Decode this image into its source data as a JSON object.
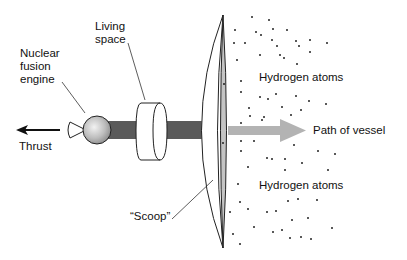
{
  "labels": {
    "nuclear_fusion_engine": [
      "Nuclear",
      "fusion",
      "engine"
    ],
    "living_space": [
      "Living",
      "space"
    ],
    "thrust": "Thrust",
    "hydrogen_atoms_top": "Hydrogen atoms",
    "hydrogen_atoms_bottom": "Hydrogen atoms",
    "path_of_vessel": "Path of vessel",
    "scoop": "“Scoop”"
  },
  "colors": {
    "shaft": "#5a5a5a",
    "engine_sphere": "#b8b8b8",
    "scoop_inner": "#c4c4c4",
    "path_arrow": "#b3b3b3",
    "outline": "#222222",
    "text": "#111111"
  },
  "components": [
    "nozzle",
    "engine-sphere",
    "shaft",
    "living-space-cylinder",
    "scoop",
    "thrust-arrow",
    "path-arrow",
    "hydrogen-atoms"
  ]
}
